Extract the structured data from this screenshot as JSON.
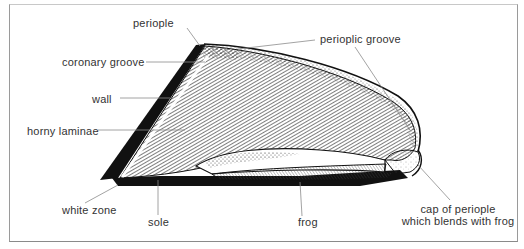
{
  "diagram": {
    "labels": {
      "periople": "periople",
      "perioplic_groove": "perioplic groove",
      "coronary_groove": "coronary groove",
      "wall": "wall",
      "horny_laminae": "horny laminae",
      "white_zone": "white zone",
      "sole": "sole",
      "frog": "frog",
      "cap_line1": "cap of periople",
      "cap_line2": "which blends with frog"
    },
    "colors": {
      "ink": "#111111",
      "leader": "#8c8c8c",
      "text": "#333333",
      "background": "#ffffff"
    }
  }
}
